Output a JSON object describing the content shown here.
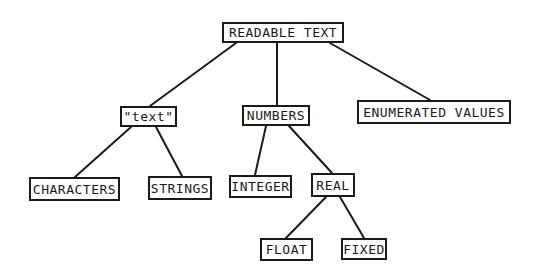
{
  "diagram": {
    "type": "tree",
    "nodes": [
      {
        "id": "readable_text",
        "label": "READABLE TEXT",
        "x": 222,
        "y": 22,
        "w": 122,
        "h": 21
      },
      {
        "id": "text",
        "label": "\"text\"",
        "x": 120,
        "y": 106,
        "w": 57,
        "h": 21
      },
      {
        "id": "numbers",
        "label": "NUMBERS",
        "x": 242,
        "y": 105,
        "w": 68,
        "h": 21
      },
      {
        "id": "enumerated_values",
        "label": "ENUMERATED VALUES",
        "x": 357,
        "y": 100,
        "w": 154,
        "h": 24
      },
      {
        "id": "characters",
        "label": "CHARACTERS",
        "x": 29,
        "y": 177,
        "w": 91,
        "h": 24
      },
      {
        "id": "strings",
        "label": "STRINGS",
        "x": 148,
        "y": 176,
        "w": 64,
        "h": 24
      },
      {
        "id": "integer",
        "label": "INTEGER",
        "x": 229,
        "y": 175,
        "w": 63,
        "h": 23
      },
      {
        "id": "real",
        "label": "REAL",
        "x": 311,
        "y": 173,
        "w": 44,
        "h": 24
      },
      {
        "id": "float",
        "label": "FLOAT",
        "x": 260,
        "y": 238,
        "w": 53,
        "h": 23
      },
      {
        "id": "fixed",
        "label": "FIXED",
        "x": 341,
        "y": 238,
        "w": 46,
        "h": 22
      }
    ],
    "edges": [
      {
        "from": "readable_text",
        "to": "text",
        "x1": 236,
        "y1": 43,
        "x2": 150,
        "y2": 106
      },
      {
        "from": "readable_text",
        "to": "numbers",
        "x1": 277,
        "y1": 43,
        "x2": 277,
        "y2": 105
      },
      {
        "from": "readable_text",
        "to": "enumerated_values",
        "x1": 330,
        "y1": 43,
        "x2": 430,
        "y2": 100
      },
      {
        "from": "text",
        "to": "characters",
        "x1": 131,
        "y1": 127,
        "x2": 75,
        "y2": 177
      },
      {
        "from": "text",
        "to": "strings",
        "x1": 156,
        "y1": 127,
        "x2": 182,
        "y2": 176
      },
      {
        "from": "numbers",
        "to": "integer",
        "x1": 266,
        "y1": 126,
        "x2": 255,
        "y2": 175
      },
      {
        "from": "numbers",
        "to": "real",
        "x1": 289,
        "y1": 126,
        "x2": 332,
        "y2": 173
      },
      {
        "from": "real",
        "to": "float",
        "x1": 326,
        "y1": 197,
        "x2": 286,
        "y2": 238
      },
      {
        "from": "real",
        "to": "fixed",
        "x1": 340,
        "y1": 197,
        "x2": 364,
        "y2": 238
      }
    ]
  }
}
